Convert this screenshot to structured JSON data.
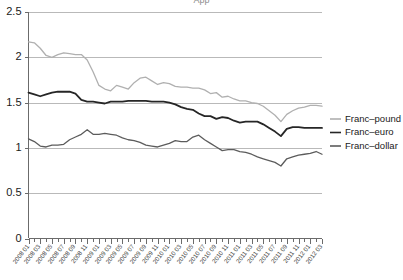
{
  "title_strip": "App",
  "chart_data": {
    "type": "line",
    "title": "",
    "xlabel": "",
    "ylabel": "",
    "ylim": [
      0,
      2.5
    ],
    "yticks": [
      0,
      0.5,
      1,
      1.5,
      2,
      2.5
    ],
    "ytick_labels": [
      "0",
      "0.5",
      "1",
      "1.5",
      "2",
      "2.5"
    ],
    "grid": true,
    "grid_axis": "y",
    "legend_position": "right",
    "x": [
      "2008 01",
      "2008 02",
      "2008 03",
      "2008 04",
      "2008 05",
      "2008 06",
      "2008 07",
      "2008 08",
      "2008 09",
      "2008 10",
      "2008 11",
      "2008 12",
      "2009 01",
      "2009 02",
      "2009 03",
      "2009 04",
      "2009 05",
      "2009 06",
      "2009 07",
      "2009 08",
      "2009 09",
      "2009 10",
      "2009 11",
      "2009 12",
      "2010 01",
      "2010 02",
      "2010 03",
      "2010 04",
      "2010 05",
      "2010 06",
      "2010 07",
      "2010 08",
      "2010 09",
      "2010 10",
      "2010 11",
      "2010 12",
      "2011 01",
      "2011 02",
      "2011 03",
      "2011 04",
      "2011 05",
      "2011 06",
      "2011 07",
      "2011 08",
      "2011 09",
      "2011 10",
      "2011 11",
      "2011 12",
      "2012 01",
      "2012 02",
      "2012 03"
    ],
    "xtick_labels": [
      "2008 01",
      "2008 03",
      "2008 05",
      "2008 07",
      "2008 09",
      "2008 11",
      "2009 01",
      "2009 03",
      "2009 05",
      "2009 07",
      "2009 09",
      "2009 11",
      "2010 01",
      "2010 03",
      "2010 05",
      "2010 07",
      "2010 09",
      "2010 11",
      "2011 01",
      "2011 03",
      "2011 05",
      "2011 07",
      "2011 09",
      "2011 11",
      "2012 01",
      "2012 03"
    ],
    "series": [
      {
        "name": "Franc–pound",
        "color": "#b0b0b0",
        "values": [
          2.17,
          2.16,
          2.1,
          2.02,
          2.0,
          2.03,
          2.05,
          2.04,
          2.03,
          2.03,
          1.97,
          1.84,
          1.69,
          1.65,
          1.63,
          1.69,
          1.67,
          1.65,
          1.72,
          1.77,
          1.78,
          1.74,
          1.7,
          1.72,
          1.71,
          1.68,
          1.67,
          1.67,
          1.66,
          1.66,
          1.64,
          1.6,
          1.61,
          1.56,
          1.57,
          1.54,
          1.52,
          1.52,
          1.5,
          1.49,
          1.46,
          1.41,
          1.36,
          1.29,
          1.37,
          1.41,
          1.44,
          1.45,
          1.47,
          1.47,
          1.46
        ]
      },
      {
        "name": "Franc–euro",
        "color": "#262626",
        "values": [
          1.61,
          1.59,
          1.57,
          1.59,
          1.61,
          1.62,
          1.62,
          1.62,
          1.6,
          1.53,
          1.51,
          1.51,
          1.5,
          1.49,
          1.51,
          1.51,
          1.51,
          1.52,
          1.52,
          1.52,
          1.52,
          1.51,
          1.51,
          1.51,
          1.5,
          1.48,
          1.45,
          1.43,
          1.42,
          1.38,
          1.35,
          1.35,
          1.32,
          1.34,
          1.33,
          1.3,
          1.28,
          1.29,
          1.29,
          1.29,
          1.26,
          1.22,
          1.18,
          1.13,
          1.21,
          1.23,
          1.23,
          1.22,
          1.22,
          1.22,
          1.22
        ]
      },
      {
        "name": "Franc–dollar",
        "color": "#5c5c5c",
        "values": [
          1.1,
          1.07,
          1.02,
          1.01,
          1.03,
          1.03,
          1.04,
          1.09,
          1.12,
          1.15,
          1.2,
          1.15,
          1.15,
          1.16,
          1.15,
          1.14,
          1.11,
          1.09,
          1.08,
          1.06,
          1.03,
          1.02,
          1.01,
          1.03,
          1.05,
          1.08,
          1.07,
          1.07,
          1.12,
          1.14,
          1.09,
          1.05,
          1.01,
          0.97,
          0.98,
          0.98,
          0.96,
          0.95,
          0.93,
          0.9,
          0.88,
          0.86,
          0.84,
          0.8,
          0.88,
          0.9,
          0.92,
          0.93,
          0.94,
          0.96,
          0.93
        ]
      }
    ]
  },
  "legend": {
    "items": [
      {
        "label": "Franc–pound",
        "color": "#b0b0b0"
      },
      {
        "label": "Franc–euro",
        "color": "#262626"
      },
      {
        "label": "Franc–dollar",
        "color": "#5c5c5c"
      }
    ]
  },
  "axes": {
    "y_label_values": [
      "2.5",
      "2",
      "1.5",
      "1",
      "0.5",
      "0"
    ]
  }
}
